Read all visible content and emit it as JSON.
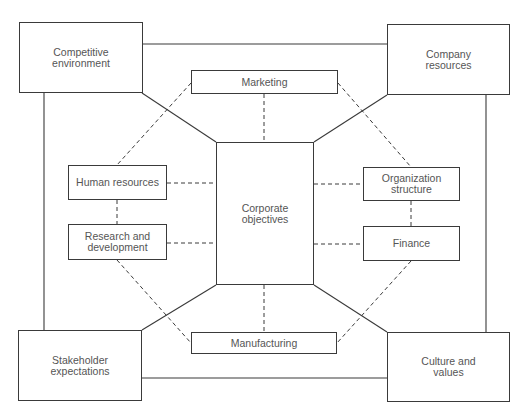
{
  "diagram": {
    "type": "strategic-planning-relationship-diagram",
    "center": {
      "id": "corporate-objectives",
      "label": "Corporate\nobjectives"
    },
    "corners": [
      {
        "id": "competitive-environment",
        "label": "Competitive\nenvironment",
        "position": "top-left"
      },
      {
        "id": "company-resources",
        "label": "Company\nresources",
        "position": "top-right"
      },
      {
        "id": "stakeholder-expectations",
        "label": "Stakeholder\nexpectations",
        "position": "bottom-left"
      },
      {
        "id": "culture-and-values",
        "label": "Culture and\nvalues",
        "position": "bottom-right"
      }
    ],
    "functions": [
      {
        "id": "marketing",
        "label": "Marketing",
        "position": "top"
      },
      {
        "id": "human-resources",
        "label": "Human resources",
        "position": "left-upper"
      },
      {
        "id": "research-and-development",
        "label": "Research and\ndevelopment",
        "position": "left-lower"
      },
      {
        "id": "organization-structure",
        "label": "Organization\nstructure",
        "position": "right-upper"
      },
      {
        "id": "finance",
        "label": "Finance",
        "position": "right-lower"
      },
      {
        "id": "manufacturing",
        "label": "Manufacturing",
        "position": "bottom"
      }
    ],
    "connections": {
      "solid": [
        [
          "competitive-environment",
          "company-resources"
        ],
        [
          "company-resources",
          "culture-and-values"
        ],
        [
          "culture-and-values",
          "stakeholder-expectations"
        ],
        [
          "stakeholder-expectations",
          "competitive-environment"
        ],
        [
          "competitive-environment",
          "corporate-objectives"
        ],
        [
          "company-resources",
          "corporate-objectives"
        ],
        [
          "stakeholder-expectations",
          "corporate-objectives"
        ],
        [
          "culture-and-values",
          "corporate-objectives"
        ]
      ],
      "dashed": [
        [
          "marketing",
          "corporate-objectives"
        ],
        [
          "manufacturing",
          "corporate-objectives"
        ],
        [
          "human-resources",
          "corporate-objectives"
        ],
        [
          "research-and-development",
          "corporate-objectives"
        ],
        [
          "organization-structure",
          "corporate-objectives"
        ],
        [
          "finance",
          "corporate-objectives"
        ],
        [
          "marketing",
          "human-resources"
        ],
        [
          "marketing",
          "organization-structure"
        ],
        [
          "human-resources",
          "research-and-development"
        ],
        [
          "organization-structure",
          "finance"
        ],
        [
          "research-and-development",
          "manufacturing"
        ],
        [
          "finance",
          "manufacturing"
        ]
      ]
    },
    "colors": {
      "line": "#3a3a3a",
      "text": "#555555",
      "background": "#ffffff"
    }
  }
}
